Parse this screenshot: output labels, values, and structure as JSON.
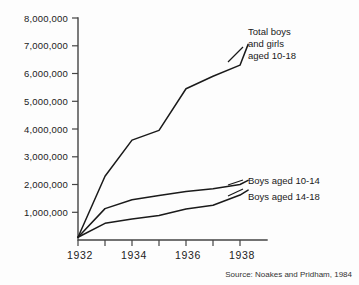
{
  "chart_data": {
    "type": "line",
    "title": "",
    "xlabel": "",
    "ylabel": "",
    "xlim": [
      1932,
      1939
    ],
    "ylim": [
      0,
      8000000
    ],
    "grid": false,
    "legend_position": "inline-annotations",
    "x_tick_labels": [
      "1932",
      "1934",
      "1936",
      "1938"
    ],
    "x_tick_values": [
      1932,
      1934,
      1936,
      1938
    ],
    "x_minor_ticks": [
      1933,
      1935,
      1937,
      1939
    ],
    "y_tick_labels": [
      "1,000,000",
      "2,000,000",
      "3,000,000",
      "4,000,000",
      "5,000,000",
      "6,000,000",
      "7,000,000",
      "8,000,000"
    ],
    "y_tick_values": [
      1000000,
      2000000,
      3000000,
      4000000,
      5000000,
      6000000,
      7000000,
      8000000
    ],
    "x": [
      1932,
      1933,
      1934,
      1935,
      1936,
      1937,
      1938,
      1938.3
    ],
    "series": [
      {
        "name": "Total boys and girls aged 10-18",
        "values": [
          100000,
          2300000,
          3600000,
          3950000,
          5450000,
          5900000,
          6300000,
          7050000
        ]
      },
      {
        "name": "Boys aged 10-14",
        "values": [
          100000,
          1130000,
          1450000,
          1600000,
          1750000,
          1850000,
          2000000,
          2150000
        ]
      },
      {
        "name": "Boys aged 14-18",
        "values": [
          100000,
          600000,
          760000,
          880000,
          1120000,
          1250000,
          1620000,
          1800000
        ]
      }
    ],
    "annotations": [
      {
        "id": "total-label",
        "lines": [
          "Total boys",
          "and girls",
          "aged 10-18"
        ]
      },
      {
        "id": "boys-10-14-label",
        "lines": [
          "Boys aged 10-14"
        ]
      },
      {
        "id": "boys-14-18-label",
        "lines": [
          "Boys aged 14-18"
        ]
      }
    ],
    "source": "Source: Noakes and Pridham, 1984",
    "colors": {
      "background": "#fdfdfd",
      "line": "#1a1a1a",
      "axis": "#444444",
      "text": "#222222"
    }
  }
}
